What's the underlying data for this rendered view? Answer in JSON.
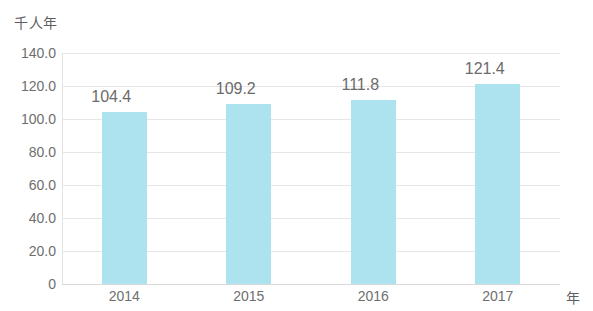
{
  "chart_data": {
    "type": "bar",
    "title": "",
    "subtitle": "",
    "xlabel": "年",
    "ylabel": "千人年",
    "categories": [
      "2014",
      "2015",
      "2016",
      "2017"
    ],
    "values": [
      104.4,
      109.2,
      111.8,
      121.4
    ],
    "data_labels": [
      "104.4",
      "109.2",
      "111.8",
      "121.4"
    ],
    "ylim": [
      0,
      140
    ],
    "ytick_values": [
      140,
      120,
      100,
      80,
      60,
      40,
      20,
      0
    ],
    "ytick_labels": [
      "140.0",
      "120.0",
      "100.0",
      "80.0",
      "60.0",
      "40.0",
      "20.0",
      "0"
    ],
    "grid": true,
    "legend": false,
    "legend_position": "none",
    "series": [
      {
        "name": "",
        "values": [
          104.4,
          109.2,
          111.8,
          121.4
        ],
        "color": "#ace3ee"
      }
    ],
    "colors": {
      "bar": "#ace3ee",
      "gridline": "#e6e6e6",
      "axis": "#d8d8d8",
      "tick_text": "#6e6e6e",
      "label_text": "#6b6b6b",
      "background": "#ffffff"
    }
  }
}
